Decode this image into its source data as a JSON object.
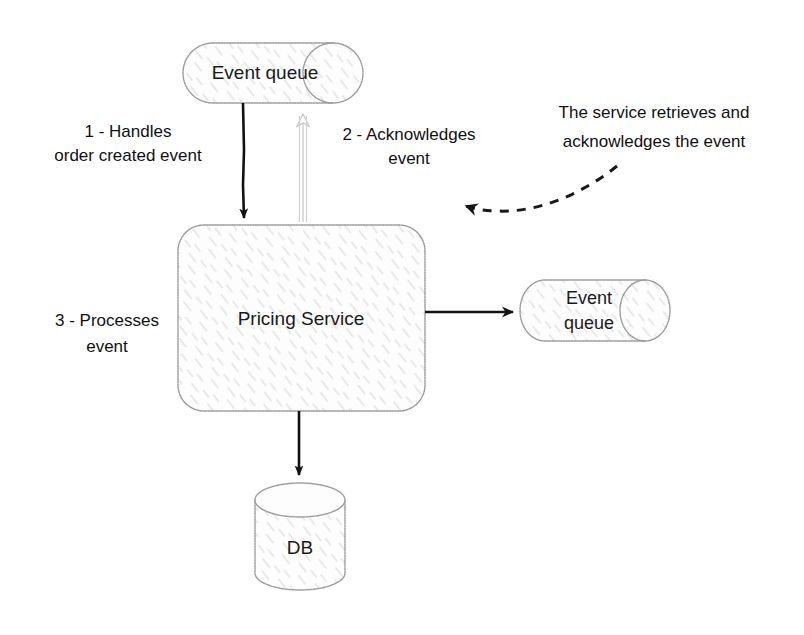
{
  "diagram": {
    "background_color": "#ffffff",
    "nodes": [
      {
        "id": "event-queue-top",
        "label": "Event queue",
        "shape": "cylinder-horizontal",
        "x": 183,
        "y": 43,
        "width": 180,
        "height": 60
      },
      {
        "id": "pricing-service",
        "label": "Pricing Service",
        "shape": "rounded-rectangle",
        "x": 178,
        "y": 225,
        "width": 247,
        "height": 186
      },
      {
        "id": "event-queue-right",
        "label_line1": "Event",
        "label_line2": "queue",
        "shape": "cylinder-horizontal",
        "x": 520,
        "y": 280,
        "width": 150,
        "height": 61
      },
      {
        "id": "database",
        "label": "DB",
        "shape": "cylinder-vertical",
        "x": 255,
        "y": 483,
        "width": 90,
        "height": 107
      }
    ],
    "edges": [
      {
        "id": "edge-handles-order-created",
        "label_line1": "1 - Handles",
        "label_line2": "order created event",
        "from": "event-queue-top",
        "to": "pricing-service",
        "style": "solid-dark",
        "direction": "down"
      },
      {
        "id": "edge-acknowledges",
        "label_line1": "2 - Acknowledges",
        "label_line2": "event",
        "from": "pricing-service",
        "to": "event-queue-top",
        "style": "outline-light",
        "direction": "up"
      },
      {
        "id": "edge-processes",
        "label_line1": "3 - Processes",
        "label_line2": "event",
        "from": "pricing-service",
        "to": "database",
        "style": "solid-dark",
        "direction": "down"
      },
      {
        "id": "edge-publish-right",
        "label": "",
        "from": "pricing-service",
        "to": "event-queue-right",
        "style": "solid-dark",
        "direction": "right"
      }
    ],
    "annotations": [
      {
        "id": "annotation-service-retrieves",
        "line1": "The service retrieves and",
        "line2": "acknowledges the event",
        "connector": "dashed-curved-arrow",
        "points_to": "pricing-service"
      }
    ]
  },
  "colors": {
    "ink": "#111111",
    "shape_outline": "#9a9a9a",
    "hatch": "#d9d9d9",
    "light_arrow": "#c9c9c9",
    "paper": "#ffffff"
  }
}
